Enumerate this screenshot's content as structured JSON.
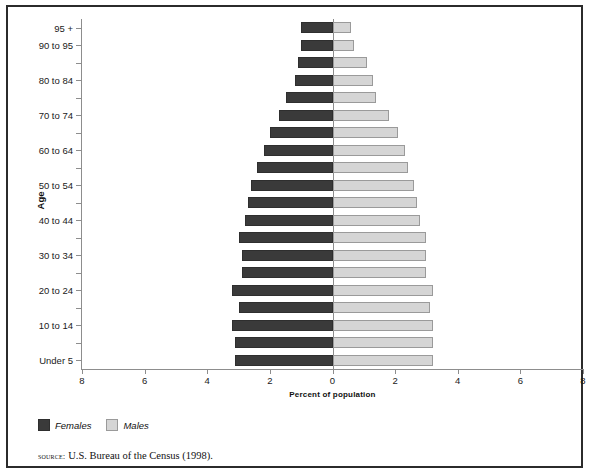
{
  "chart_data": {
    "type": "bar",
    "title": "",
    "subtitle": "",
    "orientation": "horizontal-pyramid",
    "xlabel": "Percent of population",
    "ylabel": "Age",
    "xlim": [
      -8,
      8
    ],
    "x_tick_labels": [
      "8",
      "6",
      "4",
      "2",
      "0",
      "2",
      "4",
      "6",
      "8"
    ],
    "x_tick_values": [
      -8,
      -6,
      -4,
      -2,
      0,
      2,
      4,
      6,
      8
    ],
    "grid": false,
    "legend_position": "below-axis-left",
    "categories": [
      "Under 5",
      "5 to 9",
      "10 to 14",
      "15 to 19",
      "20 to 24",
      "25 to 29",
      "30 to 34",
      "35 to 39",
      "40 to 44",
      "45 to 49",
      "50 to 54",
      "55 to 59",
      "60 to 64",
      "65 to 69",
      "70 to 74",
      "75 to 79",
      "80 to 84",
      "85 to 89",
      "90 to 95",
      "95 +"
    ],
    "category_labels_shown": [
      "Under 5",
      "10 to 14",
      "20 to 24",
      "30 to 34",
      "40 to 44",
      "50 to 54",
      "60 to 64",
      "70 to 74",
      "80 to 84",
      "90 to 95",
      "95 +"
    ],
    "series": [
      {
        "name": "Females",
        "color": "#3a3a3a",
        "side": "left",
        "values": [
          3.1,
          3.1,
          3.2,
          3.0,
          3.2,
          2.9,
          2.9,
          3.0,
          2.8,
          2.7,
          2.6,
          2.4,
          2.2,
          2.0,
          1.7,
          1.5,
          1.2,
          1.1,
          1.0,
          1.0
        ]
      },
      {
        "name": "Males",
        "color": "#d5d5d5",
        "side": "right",
        "values": [
          3.2,
          3.2,
          3.2,
          3.1,
          3.2,
          3.0,
          3.0,
          3.0,
          2.8,
          2.7,
          2.6,
          2.4,
          2.3,
          2.1,
          1.8,
          1.4,
          1.3,
          1.1,
          0.7,
          0.6
        ]
      }
    ]
  },
  "axes": {
    "y_title": "Age",
    "x_title": "Percent of population"
  },
  "legend": {
    "items": [
      {
        "label": "Females",
        "color": "#3a3a3a",
        "swatch": "females"
      },
      {
        "label": "Males",
        "color": "#d5d5d5",
        "swatch": "males"
      }
    ]
  },
  "source": {
    "label": "source:",
    "text": "U.S. Bureau of the Census (1998)."
  }
}
